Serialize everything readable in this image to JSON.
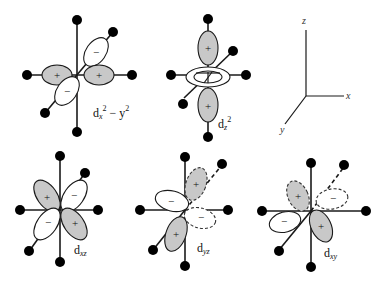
{
  "figure": {
    "orbitals": [
      {
        "id": "dx2y2",
        "label_main": "d",
        "label_sub": "x",
        "label_sup1": "2",
        "label_mid": " − y",
        "label_sup2": "2",
        "lobe_signs": [
          "+",
          "+",
          "−",
          "−"
        ]
      },
      {
        "id": "dz2",
        "label_main": "d",
        "label_sub": "z",
        "label_sup": "2",
        "lobe_signs": [
          "+",
          "+"
        ]
      },
      {
        "id": "dxz",
        "label_main": "d",
        "label_sub": "xz",
        "lobe_signs": [
          "+",
          "−",
          "−",
          "+"
        ]
      },
      {
        "id": "dyz",
        "label_main": "d",
        "label_sub": "yz",
        "lobe_signs": [
          "+",
          "−",
          "−",
          "+"
        ]
      },
      {
        "id": "dxy",
        "label_main": "d",
        "label_sub": "xy",
        "lobe_signs": [
          "+",
          "−",
          "−",
          "+"
        ]
      }
    ],
    "axes": {
      "x": "x",
      "y": "y",
      "z": "z"
    },
    "colors": {
      "positive_lobe": "#c8c8c8",
      "negative_lobe": "#ffffff",
      "ligand": "#000000"
    }
  }
}
